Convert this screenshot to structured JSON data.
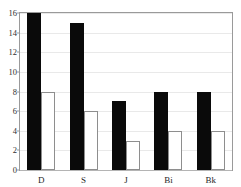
{
  "clipped_caption": {
    "text": "ᵔ   ᵔ   ᵔ   ᵔ"
  },
  "chart_data": {
    "type": "bar",
    "title": "",
    "subtitle": "",
    "xlabel": "",
    "ylabel": "",
    "categories": [
      "D",
      "S",
      "J",
      "Bi",
      "Bk"
    ],
    "series": [
      {
        "name": "black-series",
        "color": "#0a0a0a",
        "fill": "solid",
        "values": [
          16,
          15,
          7,
          8,
          8
        ]
      },
      {
        "name": "white-series",
        "color": "#ffffff",
        "outline": "#8e8e8e",
        "fill": "hollow",
        "values": [
          8,
          6,
          3,
          4,
          4
        ]
      }
    ],
    "ylim": [
      0,
      16
    ],
    "ytick_values": [
      0,
      2,
      4,
      6,
      8,
      10,
      12,
      14,
      16
    ],
    "ytick_labels": [
      "0",
      "2",
      "4",
      "6",
      "8",
      "10",
      "12",
      "14",
      "16"
    ],
    "grid": true,
    "grid_axis": "y",
    "grid_color": "#e9e9e9",
    "legend": false,
    "legend_position": "none",
    "frame_color": "#9a9a9a",
    "background": "#ffffff"
  }
}
